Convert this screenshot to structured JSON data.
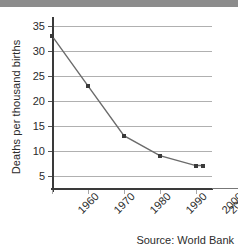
{
  "chart_data": {
    "type": "line",
    "title": "",
    "xlabel": "",
    "ylabel": "Deaths per thousand births",
    "x": [
      "1960",
      "1970",
      "1980",
      "1990",
      "2000",
      "2002"
    ],
    "values": [
      33,
      23,
      13,
      9,
      7,
      7
    ],
    "categories": [
      "1960",
      "1970",
      "1980",
      "1990",
      "2000",
      "2002"
    ],
    "series": [
      {
        "name": "Deaths per thousand births",
        "values": [
          33,
          23,
          13,
          9,
          7,
          7
        ]
      }
    ],
    "ylim": [
      2.5,
      36
    ],
    "yticks": [
      5,
      10,
      15,
      20,
      25,
      30,
      35
    ],
    "ytick_labels": [
      "5",
      "10",
      "15",
      "20",
      "25",
      "30",
      "35"
    ],
    "xtick_labels": [
      "1960",
      "1970",
      "1980",
      "1990",
      "2000",
      "2002"
    ],
    "grid": "horizontal",
    "legend": "none",
    "marker": "square",
    "line_color": "#6b6b6b",
    "marker_color": "#3a3a3a",
    "grid_color": "#b0b0b0",
    "axis_color": "#3a3a3a",
    "annotations": [
      "Source: World Bank"
    ]
  },
  "footer": {
    "source_text": "Source: World Bank"
  }
}
